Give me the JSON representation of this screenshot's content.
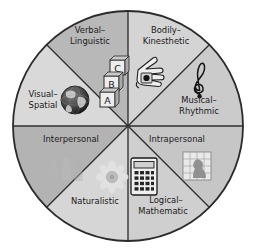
{
  "diagram": {
    "type": "pie-wheel",
    "center": {
      "x": 128,
      "y": 126
    },
    "radius": 115,
    "sector_count": 8,
    "colors": {
      "background": "#ffffff",
      "outline": "#2b2b2b",
      "divider": "#2b2b2b",
      "text": "#1a1a1a",
      "tone_light": "#d8d8d8",
      "tone_mid": "#c9c9c9",
      "tone_dark": "#b0b0b0",
      "tone_darker": "#a6a6a6"
    },
    "sectors": [
      {
        "id": "verbal-linguistic",
        "label_lines": [
          "Verbal–",
          "Linguistic"
        ],
        "icon": "abc-blocks-icon",
        "icon_letters": [
          "C",
          "B",
          "A"
        ],
        "fill": "#d4d4d4",
        "start_deg": -90,
        "end_deg": -45,
        "label_pos": {
          "x": 90,
          "y": 33
        },
        "icon_pos": {
          "x": 114,
          "y": 77
        }
      },
      {
        "id": "bodily-kinesthetic",
        "label_lines": [
          "Bodily–",
          "Kinesthetic"
        ],
        "icon": "hand-icon",
        "fill": "#cbcbcb",
        "start_deg": -45,
        "end_deg": 0,
        "label_pos": {
          "x": 166,
          "y": 33
        },
        "icon_pos": {
          "x": 149,
          "y": 72
        }
      },
      {
        "id": "musical-rhythmic",
        "label_lines": [
          "Musical–",
          "Rhythmic"
        ],
        "icon": "treble-clef-icon",
        "fill": "#c6c6c6",
        "start_deg": 0,
        "end_deg": 45,
        "label_pos": {
          "x": 196,
          "y": 100
        },
        "icon_pos": {
          "x": 199,
          "y": 80
        }
      },
      {
        "id": "intrapersonal",
        "label_lines": [
          "Intrapersonal"
        ],
        "icon": "head-in-grid-icon",
        "fill": "#cfcfcf",
        "start_deg": 45,
        "end_deg": 90,
        "label_pos": {
          "x": 176,
          "y": 139
        },
        "icon_pos": {
          "x": 197,
          "y": 167
        }
      },
      {
        "id": "logical-mathematic",
        "label_lines": [
          "Logical–",
          "Mathematic"
        ],
        "icon": "calculator-icon",
        "fill": "#d6d6d6",
        "start_deg": 90,
        "end_deg": 135,
        "label_pos": {
          "x": 163,
          "y": 202
        },
        "icon_pos": {
          "x": 144,
          "y": 177
        }
      },
      {
        "id": "naturalistic",
        "label_lines": [
          "Naturalistic"
        ],
        "icon": "flower-icon",
        "fill": "#b3b3b3",
        "start_deg": 135,
        "end_deg": 180,
        "label_pos": {
          "x": 94,
          "y": 203
        },
        "icon_pos": {
          "x": 112,
          "y": 177
        }
      },
      {
        "id": "interpersonal",
        "label_lines": [
          "Interpersonal"
        ],
        "icon": "people-silhouettes-icon",
        "fill": "#d9d9d9",
        "start_deg": 180,
        "end_deg": 225,
        "label_pos": {
          "x": 72,
          "y": 139
        },
        "icon_pos": {
          "x": 60,
          "y": 167
        }
      },
      {
        "id": "visual-spatial",
        "label_lines": [
          "Visual–",
          "Spatial"
        ],
        "icon": "globe-icon",
        "fill": "#b8b8b8",
        "start_deg": 225,
        "end_deg": 270,
        "label_pos": {
          "x": 42,
          "y": 98
        },
        "icon_pos": {
          "x": 75,
          "y": 100
        }
      }
    ]
  }
}
